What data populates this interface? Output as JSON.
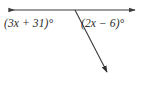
{
  "figure": {
    "type": "geometry-diagram",
    "width": 144,
    "height": 91,
    "background_color": "#ffffff",
    "stroke_color": "#3a3a3a",
    "stroke_width": 1
  },
  "labels": {
    "left_angle": "(3x + 31)°",
    "right_angle": "(2x − 6)°"
  },
  "geometry": {
    "vertex": {
      "x": 75,
      "y": 10
    },
    "horizontal_line": {
      "name": "line-with-double-arrow",
      "start": {
        "x": 6,
        "y": 10
      },
      "end": {
        "x": 138,
        "y": 10
      },
      "arrowhead_start": true,
      "arrowhead_end": true
    },
    "ray": {
      "name": "ray-down-right",
      "start": {
        "x": 75,
        "y": 10
      },
      "end": {
        "x": 111,
        "y": 79
      },
      "arrowhead_start": false,
      "arrowhead_end": true
    }
  }
}
